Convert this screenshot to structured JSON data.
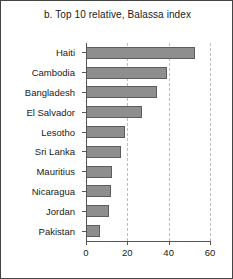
{
  "chart_data": {
    "type": "bar",
    "orientation": "horizontal",
    "title": "b. Top 10 relative, Balassa index",
    "xlabel": "",
    "ylabel": "",
    "categories": [
      "Haiti",
      "Cambodia",
      "Bangladesh",
      "El Salvador",
      "Lesotho",
      "Sri Lanka",
      "Mauritius",
      "Nicaragua",
      "Jordan",
      "Pakistan"
    ],
    "values": [
      52.5,
      39,
      34.5,
      27,
      19,
      17,
      12.5,
      12,
      11,
      7
    ],
    "xlim": [
      0,
      60
    ],
    "xticks": [
      0,
      20,
      40,
      60
    ],
    "xtick_labels": [
      "0",
      "20",
      "40",
      "60"
    ],
    "grid": true,
    "grid_axis": "x",
    "grid_style": "dashed",
    "legend": false,
    "bar_color": "#8e8e8e",
    "bar_edge_color": "#5d5d5d",
    "grid_color": "#bdbdbd",
    "axis_color": "#555555",
    "frame_color": "#444444",
    "background": "#ffffff"
  }
}
